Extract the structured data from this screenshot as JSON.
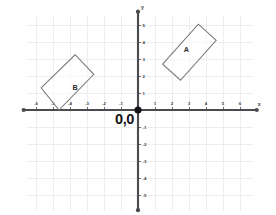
{
  "figure": {
    "kind": "cartesian-coordinate-plane",
    "background_color": "#ffffff",
    "width": 276,
    "height": 215
  },
  "axes": {
    "x_axis_label": "x",
    "y_axis_label": "y",
    "origin_label": "0,0",
    "axis_color": "#4a4a4f",
    "grid_color": "#ededf0",
    "x_tick_labels": [
      "-6",
      "-5",
      "-4",
      "-3",
      "-2",
      "-1",
      "1",
      "2",
      "3",
      "4",
      "5",
      "6"
    ],
    "y_tick_labels": [
      "5",
      "4",
      "3",
      "2",
      "1",
      "-1",
      "-2",
      "-3",
      "-4",
      "-5"
    ]
  },
  "chart_data": {
    "type": "scatter",
    "title": "",
    "xlabel": "x",
    "ylabel": "y",
    "xlim": [
      -6.6,
      6.8
    ],
    "ylim": [
      -6.0,
      5.7
    ],
    "grid": true,
    "legend": "none",
    "origin_annotation": "0,0",
    "x_ticks": [
      -6,
      -5,
      -4,
      -3,
      -2,
      -1,
      1,
      2,
      3,
      4,
      5,
      6
    ],
    "y_ticks": [
      5,
      4,
      3,
      2,
      1,
      -1,
      -2,
      -3,
      -4,
      -5
    ],
    "shapes": [
      {
        "name": "A",
        "type": "rectangle",
        "label": "A",
        "label_point": [
          2.85,
          3.55
        ],
        "stroke_color": "#77777d",
        "vertices": [
          [
            1.45,
            2.7
          ],
          [
            3.55,
            5.05
          ],
          [
            4.6,
            4.1
          ],
          [
            2.5,
            1.75
          ]
        ]
      },
      {
        "name": "B",
        "type": "rectangle",
        "label": "B",
        "label_point": [
          -3.7,
          1.35
        ],
        "stroke_point": "#77777d",
        "stroke_color": "#77777d",
        "vertices": [
          [
            -5.7,
            1.3
          ],
          [
            -3.7,
            3.25
          ],
          [
            -2.6,
            2.1
          ],
          [
            -4.65,
            0.0
          ]
        ]
      }
    ]
  }
}
